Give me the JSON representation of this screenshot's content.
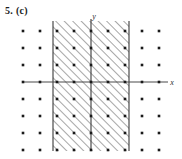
{
  "figure": {
    "problem_label": "5. (c)",
    "axis_labels": {
      "x": "x",
      "y": "y"
    },
    "colors": {
      "axis": "#4a4a4a",
      "boundary": "#3a3a3a",
      "lattice_dot": "#1a1a1a",
      "hatch": "#7d7d7d",
      "background": "#ffffff"
    }
  },
  "chart_data": {
    "type": "scatter",
    "title": "5. (c)",
    "xlabel": "x",
    "ylabel": "y",
    "grid": false,
    "legend": null,
    "xlim": [
      -4.5,
      4.5
    ],
    "ylim": [
      -4.5,
      4.5
    ],
    "lattice": {
      "description": "integer lattice points plotted as solid square dots",
      "x_values": [
        -4,
        -3,
        -2,
        -1,
        0,
        1,
        2,
        3,
        4
      ],
      "y_values": [
        -4,
        -3,
        -2,
        -1,
        0,
        1,
        2,
        3,
        4
      ],
      "columns_drawn": [
        -4,
        -3,
        -2,
        -1,
        0,
        1,
        2,
        3,
        4
      ],
      "rows_drawn": [
        -4,
        -3,
        -2,
        -1,
        0,
        1,
        2,
        3,
        4
      ]
    },
    "shaded_region": {
      "style": "diagonal-hatch",
      "hatch_direction": "up-right",
      "x_min": -2,
      "x_max": 2,
      "y_min": "-inf",
      "y_max": "+inf",
      "boundary": "solid",
      "label": "vertical strip between x = -2 and x = 2"
    },
    "axes": {
      "x_axis_y": 0,
      "y_axis_x": 0,
      "ticks_shown": false
    }
  },
  "geometry": {
    "plot_left": 22,
    "plot_right": 166,
    "plot_top": 21,
    "plot_bottom": 151,
    "origin_x": 91,
    "origin_y": 82,
    "step": 17,
    "band_left": 53,
    "band_right": 129,
    "dot_size": 2.6
  }
}
